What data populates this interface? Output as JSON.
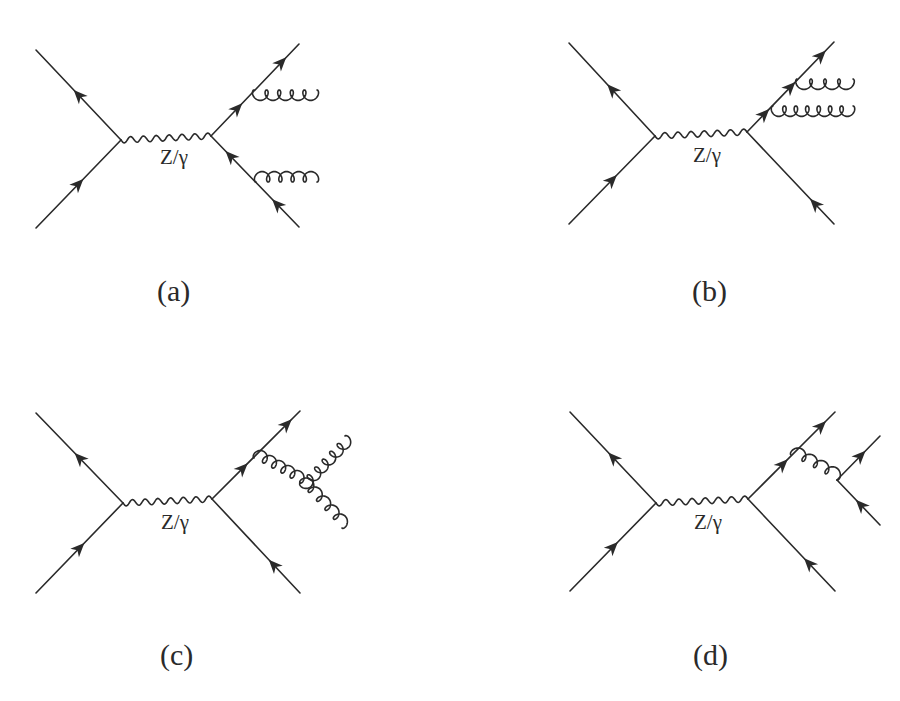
{
  "figure": {
    "colors": {
      "line": "#2a2a2a",
      "background": "#ffffff"
    },
    "panels": [
      {
        "id": "a",
        "label": "(a)",
        "propagator_label": "Z/γ",
        "process": "q qbar -> Z/γ -> q qbar with one gluon emitted from each outgoing quark line",
        "external_lines": [
          "incoming quark",
          "incoming antiquark",
          "outgoing quark",
          "outgoing antiquark",
          "gluon",
          "gluon"
        ]
      },
      {
        "id": "b",
        "label": "(b)",
        "propagator_label": "Z/γ",
        "process": "q qbar -> Z/γ -> q qbar with two gluons emitted from the outgoing quark line",
        "external_lines": [
          "incoming quark",
          "incoming antiquark",
          "outgoing quark",
          "outgoing antiquark",
          "gluon",
          "gluon"
        ]
      },
      {
        "id": "c",
        "label": "(c)",
        "propagator_label": "Z/γ",
        "process": "q qbar -> Z/γ -> q qbar with a gluon splitting into two gluons (triple-gluon vertex)",
        "external_lines": [
          "incoming quark",
          "incoming antiquark",
          "outgoing quark",
          "outgoing antiquark",
          "gluon",
          "gluon"
        ]
      },
      {
        "id": "d",
        "label": "(d)",
        "propagator_label": "Z/γ",
        "process": "q qbar -> Z/γ -> q qbar with a gluon splitting into a quark-antiquark pair",
        "external_lines": [
          "incoming quark",
          "incoming antiquark",
          "outgoing quark",
          "outgoing antiquark",
          "quark",
          "antiquark"
        ]
      }
    ]
  }
}
